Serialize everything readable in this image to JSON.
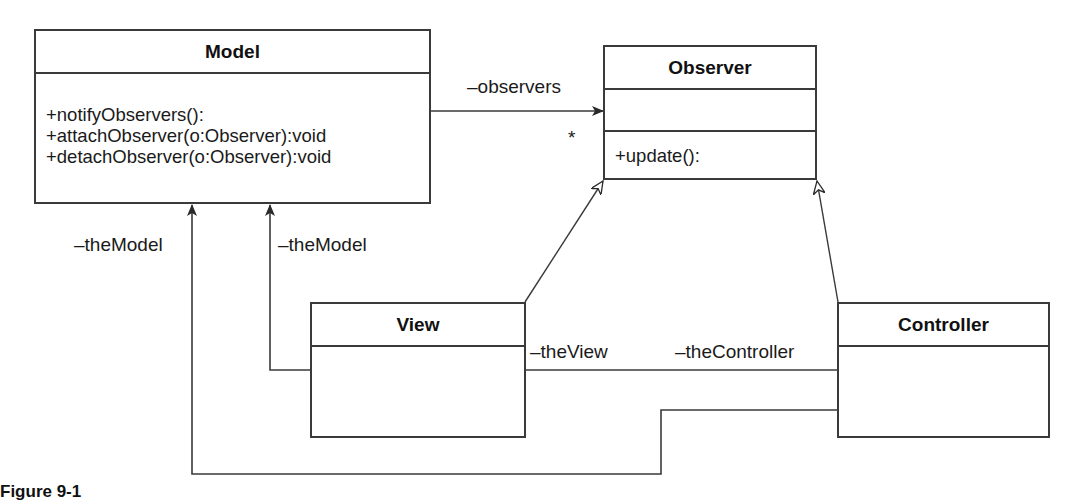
{
  "diagram": {
    "type": "UML class diagram",
    "classes": {
      "model": {
        "name": "Model",
        "attributes": [],
        "operations": [
          "+notifyObservers():",
          "+attachObserver(o:Observer):void",
          "+detachObserver(o:Observer):void"
        ]
      },
      "observer": {
        "name": "Observer",
        "attributes": [],
        "operations": [
          "+update():"
        ]
      },
      "view": {
        "name": "View",
        "attributes": [],
        "operations": []
      },
      "controller": {
        "name": "Controller",
        "attributes": [],
        "operations": []
      }
    },
    "relations": [
      {
        "from": "Model",
        "to": "Observer",
        "kind": "association",
        "role": "–observers",
        "multiplicity": "*"
      },
      {
        "from": "View",
        "to": "Observer",
        "kind": "realization"
      },
      {
        "from": "Controller",
        "to": "Observer",
        "kind": "realization"
      },
      {
        "from": "View",
        "to": "Model",
        "kind": "association",
        "role": "–theModel"
      },
      {
        "from": "Controller",
        "to": "Model",
        "kind": "association",
        "role": "–theModel"
      },
      {
        "from": "View",
        "to": "Controller",
        "kind": "association",
        "role_view": "–theView",
        "role_controller": "–theController"
      }
    ],
    "labels": {
      "observers_role": "–observers",
      "observers_multiplicity": "*",
      "controller_model_role": "–theModel",
      "view_model_role": "–theModel",
      "view_role": "–theView",
      "controller_role": "–theController"
    },
    "caption": "Figure 9-1"
  },
  "colors": {
    "line": "#3a3a3a",
    "background": "#ffffff",
    "text": "#1a1a1a"
  }
}
